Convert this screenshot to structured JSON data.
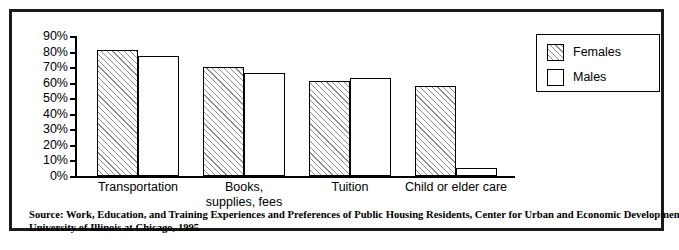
{
  "chart_data": {
    "type": "bar",
    "title": "",
    "xlabel": "",
    "ylabel": "",
    "ylim": [
      0,
      90
    ],
    "ytick_values": [
      90,
      80,
      70,
      60,
      50,
      40,
      30,
      20,
      10,
      0
    ],
    "ytick_labels": [
      "90%",
      "80%",
      "70%",
      "60%",
      "50%",
      "40%",
      "30%",
      "20%",
      "10%",
      "0%"
    ],
    "grid": false,
    "legend_position": "top-right",
    "categories": [
      "Transportation",
      "Books,\nsupplies, fees",
      "Tuition",
      "Child or elder care"
    ],
    "category_lines": [
      [
        "Transportation"
      ],
      [
        "Books,",
        "supplies, fees"
      ],
      [
        "Tuition"
      ],
      [
        "Child or elder care"
      ]
    ],
    "series": [
      {
        "name": "Females",
        "values": [
          81,
          70,
          61,
          58
        ],
        "fill": "hatched-diagonal"
      },
      {
        "name": "Males",
        "values": [
          77,
          66,
          63,
          5
        ],
        "fill": "white"
      }
    ]
  },
  "legend": {
    "items": [
      {
        "label": "Females",
        "swatch": "hatched-diagonal"
      },
      {
        "label": "Males",
        "swatch": "white"
      }
    ]
  },
  "source_note": {
    "line1": "Source: Work, Education, and Training Experiences and Preferences of Public Housing Residents, Center for Urban and Economic Development,",
    "line2": "University of Illinois at Chicago, 1995"
  },
  "colors": {
    "frame": "#1a1a1a",
    "axis": "#000000",
    "hatch": "#8d8d8d",
    "background": "#ffffff",
    "text": "#000000"
  }
}
